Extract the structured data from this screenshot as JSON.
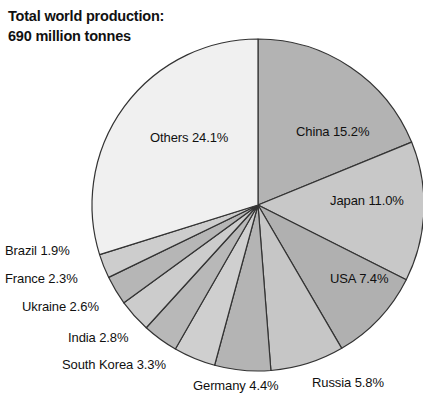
{
  "title": {
    "line1": "Total world production:",
    "line2": "690 million tonnes"
  },
  "chart_data": {
    "type": "pie",
    "title": "Total world production: 690 million tonnes",
    "unit": "percent",
    "total_label": "690 million tonnes",
    "legend": "none",
    "labels_inline": true,
    "categories": [
      "China",
      "Japan",
      "USA",
      "Russia",
      "Germany",
      "South Korea",
      "India",
      "Ukraine",
      "France",
      "Brazil",
      "Others"
    ],
    "values": [
      15.2,
      11.0,
      7.4,
      5.8,
      4.4,
      3.3,
      2.8,
      2.6,
      2.3,
      1.9,
      24.1
    ],
    "slices": [
      {
        "name": "China",
        "value": 15.2,
        "label": "China 15.2%",
        "color": "#b3b3b3",
        "label_pos": "inside"
      },
      {
        "name": "Japan",
        "value": 11.0,
        "label": "Japan 11.0%",
        "color": "#c8c8c8",
        "label_pos": "inside"
      },
      {
        "name": "USA",
        "value": 7.4,
        "label": "USA 7.4%",
        "color": "#b0b0b0",
        "label_pos": "inside"
      },
      {
        "name": "Russia",
        "value": 5.8,
        "label": "Russia 5.8%",
        "color": "#c6c6c6",
        "label_pos": "outside"
      },
      {
        "name": "Germany",
        "value": 4.4,
        "label": "Germany 4.4%",
        "color": "#b4b4b4",
        "label_pos": "outside"
      },
      {
        "name": "South Korea",
        "value": 3.3,
        "label": "South Korea 3.3%",
        "color": "#cfcfcf",
        "label_pos": "outside"
      },
      {
        "name": "India",
        "value": 2.8,
        "label": "India 2.8%",
        "color": "#b8b8b8",
        "label_pos": "outside"
      },
      {
        "name": "Ukraine",
        "value": 2.6,
        "label": "Ukraine 2.6%",
        "color": "#cccccc",
        "label_pos": "outside"
      },
      {
        "name": "France",
        "value": 2.3,
        "label": "France 2.3%",
        "color": "#b6b6b6",
        "label_pos": "outside"
      },
      {
        "name": "Brazil",
        "value": 1.9,
        "label": "Brazil 1.9%",
        "color": "#cdcdcd",
        "label_pos": "outside"
      },
      {
        "name": "Others",
        "value": 24.1,
        "label": "Others 24.1%",
        "color": "#f0f0f0",
        "label_pos": "inside"
      }
    ]
  },
  "geometry": {
    "cx": 258,
    "cy": 205,
    "r": 166,
    "start_angle_deg": -90,
    "direction": "clockwise",
    "stroke": "#333333",
    "stroke_width": 1.2,
    "background": "#ffffff"
  },
  "label_positions": {
    "China": {
      "x": 296,
      "y": 124,
      "anchor": "start"
    },
    "Japan": {
      "x": 330,
      "y": 193,
      "anchor": "start"
    },
    "USA": {
      "x": 330,
      "y": 271,
      "anchor": "start"
    },
    "Russia": {
      "x": 312,
      "y": 375,
      "anchor": "start"
    },
    "Germany": {
      "x": 193,
      "y": 378,
      "anchor": "start"
    },
    "South Korea": {
      "x": 62,
      "y": 357,
      "anchor": "start"
    },
    "India": {
      "x": 68,
      "y": 330,
      "anchor": "start"
    },
    "Ukraine": {
      "x": 22,
      "y": 299,
      "anchor": "start"
    },
    "France": {
      "x": 5,
      "y": 271,
      "anchor": "start"
    },
    "Brazil": {
      "x": 5,
      "y": 243,
      "anchor": "start"
    },
    "Others": {
      "x": 150,
      "y": 130,
      "anchor": "start"
    }
  }
}
